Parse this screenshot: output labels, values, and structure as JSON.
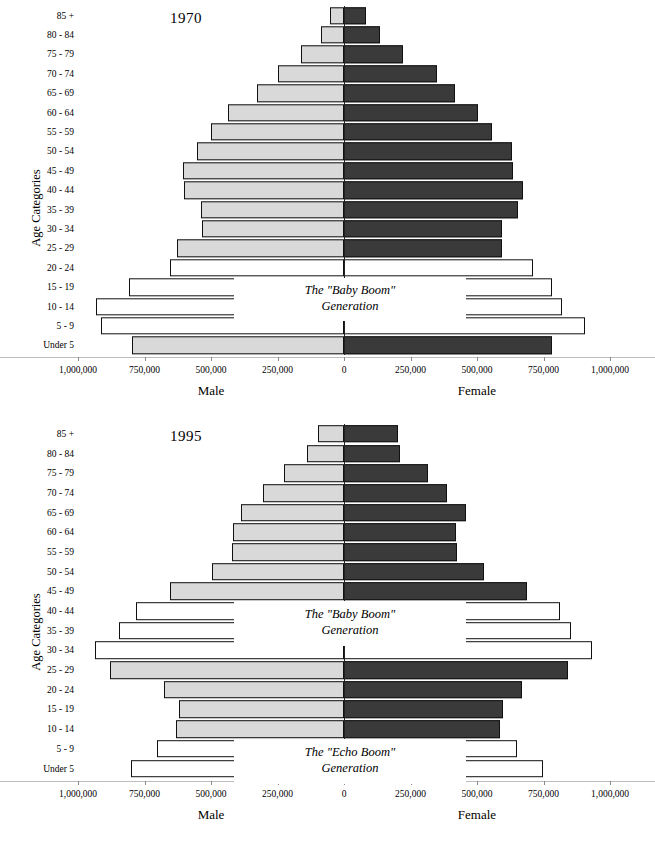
{
  "figure": {
    "axis_title_y": "Age Categories",
    "male_label": "Male",
    "female_label": "Female",
    "x_tick_labels": [
      "1,000,000",
      "750,000",
      "500,000",
      "250,000",
      "0",
      "250,000",
      "500,000",
      "750,000",
      "1,000,000"
    ],
    "colors": {
      "light_fill": "#d9d9d9",
      "dark_fill": "#3a3a3a",
      "white_fill": "#ffffff",
      "outline": "#111111"
    }
  },
  "chart_data": [
    {
      "type": "bar",
      "title": "1970",
      "subtitle": "",
      "xlabel": "",
      "ylabel": "Age Categories",
      "xlim": [
        -1000000,
        1000000
      ],
      "xticks": [
        -1000000,
        -750000,
        -500000,
        -250000,
        0,
        250000,
        500000,
        750000,
        1000000
      ],
      "xtick_labels": [
        "1,000,000",
        "750,000",
        "500,000",
        "250,000",
        "0",
        "250,000",
        "500,000",
        "750,000",
        "1,000,000"
      ],
      "grid": false,
      "legend": "none",
      "categories": [
        "85 +",
        "80 - 84",
        "75 - 79",
        "70 - 74",
        "65 - 69",
        "60 - 64",
        "55 - 59",
        "50 - 54",
        "45 - 49",
        "40 - 44",
        "35 - 39",
        "30 - 34",
        "25 - 29",
        "20 - 24",
        "15 - 19",
        "10 - 14",
        "5 - 9",
        "Under 5"
      ],
      "series": [
        {
          "name": "Male",
          "side": "left",
          "values": [
            53000,
            86000,
            162000,
            248000,
            327000,
            436000,
            500000,
            553000,
            605000,
            602000,
            538000,
            534000,
            628000,
            654000,
            808000,
            932000,
            914000,
            797000
          ],
          "fills": [
            "light",
            "light",
            "light",
            "light",
            "light",
            "light",
            "light",
            "light",
            "light",
            "light",
            "light",
            "light",
            "light",
            "white",
            "white",
            "white",
            "white",
            "light"
          ]
        },
        {
          "name": "Female",
          "side": "right",
          "values": [
            83000,
            135000,
            222000,
            350000,
            417000,
            504000,
            556000,
            632000,
            635000,
            673000,
            654000,
            594000,
            594000,
            711000,
            782000,
            820000,
            906000,
            782000
          ],
          "fills": [
            "dark",
            "dark",
            "dark",
            "dark",
            "dark",
            "dark",
            "dark",
            "dark",
            "dark",
            "dark",
            "dark",
            "dark",
            "dark",
            "white",
            "white",
            "white",
            "white",
            "dark"
          ]
        }
      ],
      "annotations": [
        {
          "id": "baby-boom",
          "line1": "The \"Baby Boom\"",
          "line2": "Generation",
          "rows": [
            "15 - 19",
            "10 - 14"
          ]
        }
      ]
    },
    {
      "type": "bar",
      "title": "1995",
      "subtitle": "",
      "xlabel": "",
      "ylabel": "Age Categories",
      "xlim": [
        -1000000,
        1000000
      ],
      "xticks": [
        -1000000,
        -750000,
        -500000,
        -250000,
        0,
        250000,
        500000,
        750000,
        1000000
      ],
      "xtick_labels": [
        "1,000,000",
        "750,000",
        "500,000",
        "250,000",
        "0",
        "250,000",
        "500,000",
        "750,000",
        "1,000,000"
      ],
      "grid": false,
      "legend": "none",
      "categories": [
        "85 +",
        "80 - 84",
        "75 - 79",
        "70 - 74",
        "65 - 69",
        "60 - 64",
        "55 - 59",
        "50 - 54",
        "45 - 49",
        "40 - 44",
        "35 - 39",
        "30 - 34",
        "25 - 29",
        "20 - 24",
        "15 - 19",
        "10 - 14",
        "5 - 9",
        "Under 5"
      ],
      "series": [
        {
          "name": "Male",
          "side": "left",
          "values": [
            98000,
            139000,
            226000,
            305000,
            387000,
            417000,
            421000,
            496000,
            654000,
            782000,
            846000,
            936000,
            880000,
            677000,
            620000,
            632000,
            703000,
            801000
          ],
          "fills": [
            "light",
            "light",
            "light",
            "light",
            "light",
            "light",
            "light",
            "light",
            "light",
            "white",
            "white",
            "white",
            "light",
            "light",
            "light",
            "light",
            "white",
            "white"
          ]
        },
        {
          "name": "Female",
          "side": "right",
          "values": [
            203000,
            211000,
            316000,
            387000,
            459000,
            421000,
            425000,
            526000,
            688000,
            812000,
            853000,
            932000,
            842000,
            669000,
            598000,
            586000,
            650000,
            748000
          ],
          "fills": [
            "dark",
            "dark",
            "dark",
            "dark",
            "dark",
            "dark",
            "dark",
            "dark",
            "dark",
            "white",
            "white",
            "white",
            "dark",
            "dark",
            "dark",
            "dark",
            "white",
            "white"
          ]
        }
      ],
      "annotations": [
        {
          "id": "baby-boom",
          "line1": "The \"Baby Boom\"",
          "line2": "Generation",
          "rows": [
            "40 - 44",
            "35 - 39"
          ]
        },
        {
          "id": "echo-boom",
          "line1": "The \"Echo Boom\"",
          "line2": "Generation",
          "rows": [
            "5 - 9",
            "Under 5"
          ]
        }
      ]
    }
  ]
}
